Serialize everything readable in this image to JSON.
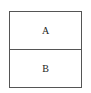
{
  "diagram": {
    "cells": [
      {
        "label": "A"
      },
      {
        "label": "B"
      }
    ],
    "colors": {
      "border": "#555555",
      "text": "#222222",
      "background": "#ffffff"
    }
  }
}
